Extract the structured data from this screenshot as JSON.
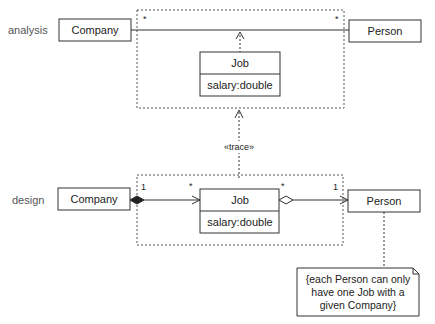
{
  "layers": {
    "analysis": "analysis",
    "design": "design"
  },
  "analysis": {
    "company": "Company",
    "person": "Person",
    "job": {
      "name": "Job",
      "attribute": "salary:double"
    },
    "mult_left": "*",
    "mult_right": "*"
  },
  "trace": "«trace»",
  "design": {
    "company": "Company",
    "person": "Person",
    "job": {
      "name": "Job",
      "attribute": "salary:double"
    },
    "mult_company": "1",
    "mult_job_left": "*",
    "mult_job_right": "*",
    "mult_person": "1"
  },
  "note": {
    "lines": [
      "{each Person can only",
      "have one Job with a",
      "given Company}"
    ]
  }
}
